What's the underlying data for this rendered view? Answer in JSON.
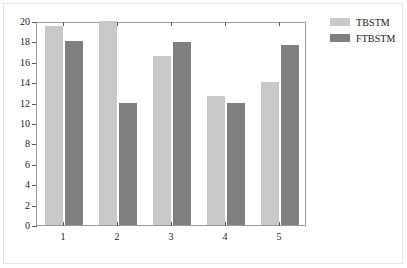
{
  "chart_data": {
    "type": "bar",
    "title": "",
    "xlabel": "",
    "ylabel": "",
    "categories": [
      "1",
      "2",
      "3",
      "4",
      "5"
    ],
    "series": [
      {
        "name": "TBSTM",
        "color": "#c9c9c9",
        "values": [
          19.5,
          20.0,
          16.6,
          12.6,
          14.0
        ]
      },
      {
        "name": "FTBSTM",
        "color": "#7f7f7f",
        "values": [
          18.0,
          12.0,
          17.9,
          12.0,
          17.6
        ]
      }
    ],
    "ylim": [
      0,
      20
    ],
    "yticks": [
      0,
      2,
      4,
      6,
      8,
      10,
      12,
      14,
      16,
      18,
      20
    ],
    "ytick_labels": [
      "0",
      "2",
      "4",
      "6",
      "8",
      "10",
      "12",
      "14",
      "16",
      "18",
      "20"
    ],
    "xtick_labels": [
      "1",
      "2",
      "3",
      "4",
      "5"
    ],
    "grid": false,
    "legend_position": "top-right"
  },
  "legend": {
    "entries": [
      {
        "label": "TBSTM"
      },
      {
        "label": "FTBSTM"
      }
    ]
  }
}
